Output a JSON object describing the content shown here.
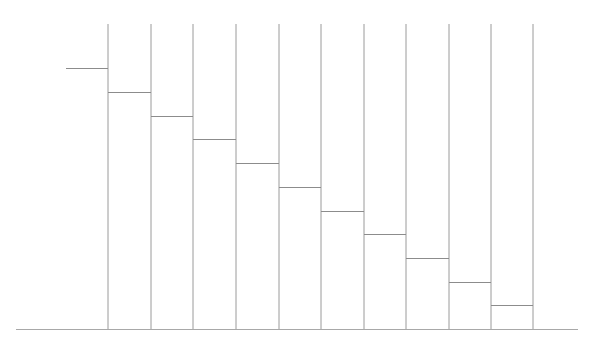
{
  "chart_data": {
    "type": "line",
    "subtype": "step",
    "title": "",
    "xlabel": "",
    "ylabel": "",
    "x": [
      0,
      1,
      2,
      3,
      4,
      5,
      6,
      7,
      8,
      9,
      10
    ],
    "values": [
      11,
      10,
      9,
      8,
      7,
      6,
      5,
      4,
      3,
      2,
      1
    ],
    "series": [
      {
        "name": "",
        "values": [
          11,
          10,
          9,
          8,
          7,
          6,
          5,
          4,
          3,
          2,
          1
        ]
      }
    ],
    "ylim": [
      0,
      13
    ],
    "grid": false,
    "vertical_boundary_lines": true,
    "legend": null,
    "colors": {
      "line": "#9a9a9a",
      "step": "#8c8c8c",
      "baseline": "#a8a8a8",
      "background": "#ffffff"
    }
  },
  "layout": {
    "baseline_y": 329,
    "baseline_x_start": 16,
    "baseline_x_end": 578,
    "vline_top": 24,
    "first_step_x_start": 66,
    "boundaries_x": [
      108,
      151,
      193,
      236,
      279,
      321,
      364,
      406,
      449,
      491,
      533
    ],
    "px_per_unit": 23.7
  }
}
